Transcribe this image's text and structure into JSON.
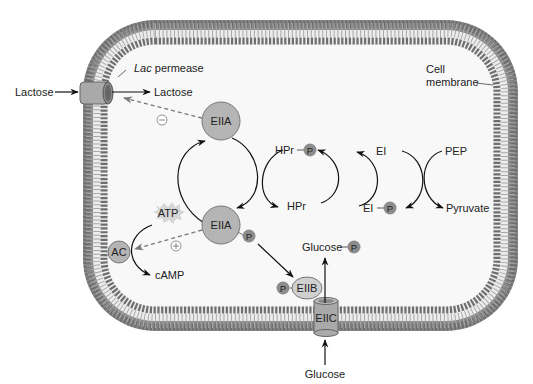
{
  "colors": {
    "membrane_head": "#7a7a7a",
    "membrane_tail": "#e8e8e8",
    "cytoplasm": "#f7f7f7",
    "protein_fill": "#b5b5b5",
    "protein_stroke": "#6a6a6a",
    "phosphate_fill": "#8c8c8c",
    "atp_burst": "#d6d6d6",
    "arrow": "#111111",
    "dashed_arrow": "#777777"
  },
  "labels": {
    "lactose_outside": "Lactose",
    "lactose_inside": "Lactose",
    "lac_permease_italic": "Lac",
    "lac_permease_rest": " permease",
    "cell_membrane_line1": "Cell",
    "cell_membrane_line2": "membrane",
    "eiia_top": "EIIA",
    "eiia_bottom": "EIIA",
    "hpr_p": "HPr",
    "hpr": "HPr",
    "ei": "EI",
    "ei_p": "EI",
    "pep": "PEP",
    "pyruvate": "Pyruvate",
    "atp": "ATP",
    "ac": "AC",
    "camp": "cAMP",
    "glucose_p": "Glucose",
    "glucose_outside": "Glucose",
    "eiib": "EIIB",
    "eiic": "EIIC",
    "phosphate": "P",
    "inhibit_sign": "−",
    "activate_sign": "+"
  }
}
